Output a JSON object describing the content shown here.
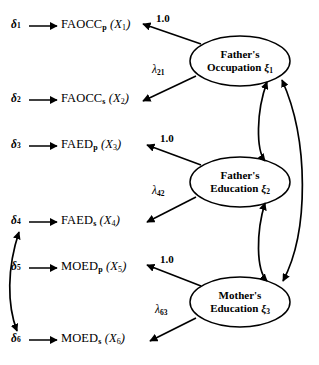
{
  "diagram": {
    "type": "path-diagram",
    "stroke_color": "#000000",
    "background_color": "#ffffff"
  },
  "errors": [
    {
      "id": "d1",
      "symbol": "δ",
      "sub": "1"
    },
    {
      "id": "d2",
      "symbol": "δ",
      "sub": "2"
    },
    {
      "id": "d3",
      "symbol": "δ",
      "sub": "3"
    },
    {
      "id": "d4",
      "symbol": "δ",
      "sub": "4"
    },
    {
      "id": "d5",
      "symbol": "δ",
      "sub": "5"
    },
    {
      "id": "d6",
      "symbol": "δ",
      "sub": "6"
    }
  ],
  "indicators": [
    {
      "id": "x1",
      "name": "FAOCC",
      "name_sub": "p",
      "var": "X",
      "var_sub": "1"
    },
    {
      "id": "x2",
      "name": "FAOCC",
      "name_sub": "s",
      "var": "X",
      "var_sub": "2"
    },
    {
      "id": "x3",
      "name": "FAED",
      "name_sub": "p",
      "var": "X",
      "var_sub": "3"
    },
    {
      "id": "x4",
      "name": "FAED",
      "name_sub": "s",
      "var": "X",
      "var_sub": "4"
    },
    {
      "id": "x5",
      "name": "MOED",
      "name_sub": "p",
      "var": "X",
      "var_sub": "5"
    },
    {
      "id": "x6",
      "name": "MOED",
      "name_sub": "s",
      "var": "X",
      "var_sub": "6"
    }
  ],
  "factors": [
    {
      "id": "xi1",
      "line1": "Father's",
      "line2": "Occupation",
      "symbol": "ξ",
      "sub": "1"
    },
    {
      "id": "xi2",
      "line1": "Father's",
      "line2": "Education",
      "symbol": "ξ",
      "sub": "2"
    },
    {
      "id": "xi3",
      "line1": "Mother's",
      "line2": "Education",
      "symbol": "ξ",
      "sub": "3"
    }
  ],
  "loadings": [
    {
      "id": "l11",
      "from": "xi1",
      "to": "x1",
      "label": "1.0",
      "fixed": true
    },
    {
      "id": "l21",
      "from": "xi1",
      "to": "x2",
      "label": "λ",
      "sub": "21",
      "fixed": false
    },
    {
      "id": "l32",
      "from": "xi2",
      "to": "x3",
      "label": "1.0",
      "fixed": true
    },
    {
      "id": "l42",
      "from": "xi2",
      "to": "x4",
      "label": "λ",
      "sub": "42",
      "fixed": false
    },
    {
      "id": "l53",
      "from": "xi3",
      "to": "x5",
      "label": "1.0",
      "fixed": true
    },
    {
      "id": "l63",
      "from": "xi3",
      "to": "x6",
      "label": "λ",
      "sub": "63",
      "fixed": false
    }
  ],
  "correlations": [
    {
      "id": "c12",
      "between": [
        "xi1",
        "xi2"
      ],
      "style": "double-headed-arc"
    },
    {
      "id": "c23",
      "between": [
        "xi2",
        "xi3"
      ],
      "style": "double-headed-arc"
    },
    {
      "id": "c13",
      "between": [
        "xi1",
        "xi3"
      ],
      "style": "double-headed-arc-outer"
    },
    {
      "id": "c46",
      "between": [
        "d4",
        "d6"
      ],
      "style": "double-headed-arc-left"
    }
  ]
}
